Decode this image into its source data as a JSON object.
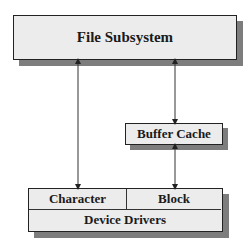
{
  "diagram": {
    "file_subsystem": {
      "label": "File Subsystem"
    },
    "buffer_cache": {
      "label": "Buffer Cache"
    },
    "device_drivers": {
      "label": "Device Drivers",
      "character": "Character",
      "block": "Block"
    },
    "connections": [
      {
        "from": "File Subsystem",
        "to": "Character",
        "bidirectional": true
      },
      {
        "from": "File Subsystem",
        "to": "Buffer Cache",
        "bidirectional": true
      },
      {
        "from": "Buffer Cache",
        "to": "Block",
        "bidirectional": true
      }
    ],
    "colors": {
      "box_fill": "#ececec",
      "border": "#222222",
      "shadow": "#7d7d7d",
      "line": "#333333"
    }
  }
}
